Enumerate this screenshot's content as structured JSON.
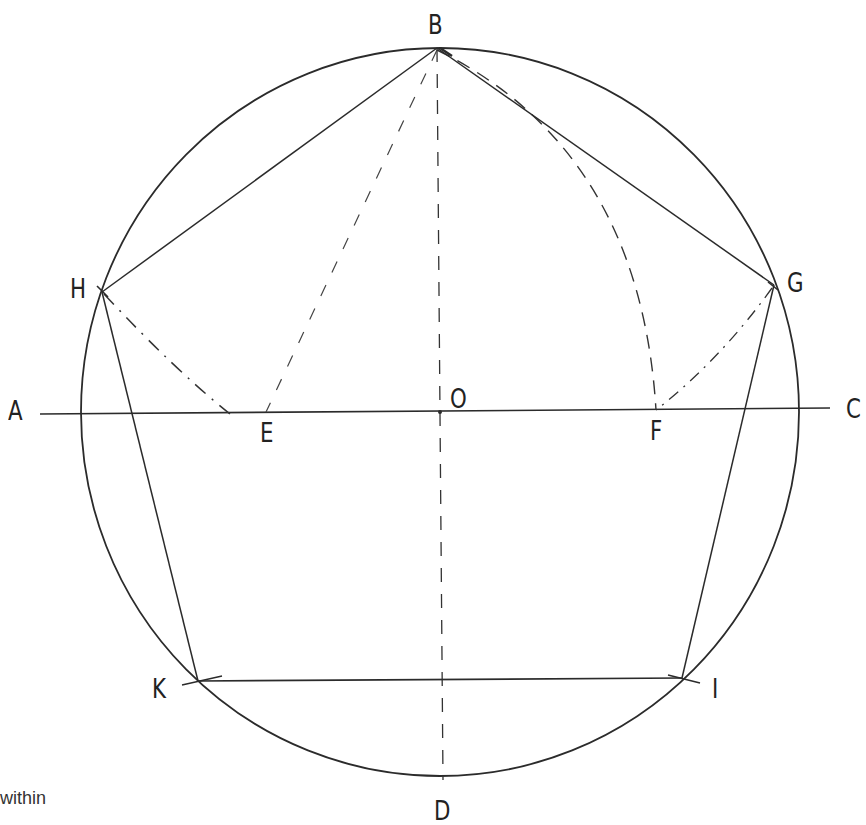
{
  "diagram": {
    "stroke_color": "#2b2b2b",
    "background": "#ffffff",
    "labels": {
      "A": "A",
      "B": "B",
      "C": "C",
      "D": "D",
      "E": "E",
      "F": "F",
      "G": "G",
      "H": "H",
      "I": "I",
      "K": "K",
      "O": "O"
    },
    "points": {
      "B": [
        437,
        48
      ],
      "H": [
        102,
        292
      ],
      "G": [
        774,
        285
      ],
      "K": [
        198,
        681
      ],
      "I": [
        682,
        678
      ],
      "E": [
        266,
        412
      ],
      "F": [
        656,
        410
      ],
      "O": [
        440,
        412
      ],
      "A_end": [
        40,
        414
      ],
      "C_end": [
        830,
        408
      ],
      "D_end": [
        443,
        778
      ]
    },
    "circle": {
      "cx": 440,
      "cy": 412,
      "rx": 359,
      "ry": 364
    },
    "pentagon": [
      "B",
      "G",
      "I",
      "K",
      "H"
    ],
    "solid_lines": [
      "A-C",
      "B-G",
      "G-I",
      "I-K",
      "K-H",
      "H-B"
    ],
    "dashed_lines": [
      "B-D",
      "B-E"
    ],
    "construction_arcs": [
      "B-F (centered E)",
      "H-E",
      "G-F"
    ]
  },
  "caption": {
    "text": "within"
  }
}
